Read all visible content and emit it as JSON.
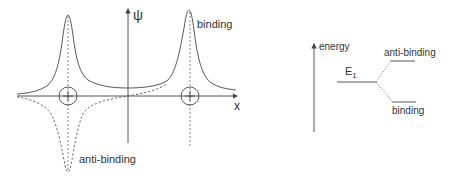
{
  "wavefunction_plot": {
    "y_axis_label": "ψ",
    "x_axis_label": "x",
    "binding_label": "binding",
    "anti_binding_label": "anti-binding",
    "nuclei": [
      {
        "name": "left-nucleus",
        "symbol": "+"
      },
      {
        "name": "right-nucleus",
        "symbol": "+"
      }
    ]
  },
  "energy_diagram": {
    "axis_label": "energy",
    "level_label": "E",
    "level_subscript": "1",
    "anti_binding_label": "anti-binding",
    "binding_label": "binding"
  },
  "colors": {
    "line": "#444444",
    "text": "#333333",
    "background": "#ffffff"
  }
}
